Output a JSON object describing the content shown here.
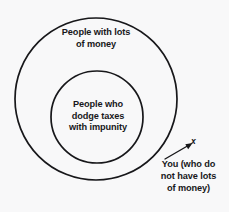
{
  "figure": {
    "background_color": "#f8f8f9",
    "ink_color": "#17171a",
    "type": "venn-diagram",
    "outer_set_label": "People with lots\nof money",
    "inner_set_label": "People who\ndodge taxes\nwith impunity",
    "you_caption": "You (who do\nnot have lots\nof money)",
    "point_marker": "x",
    "geometry": {
      "outer_circle": {
        "cx": 96,
        "cy": 99,
        "r": 81
      },
      "inner_circle": {
        "cx": 97,
        "cy": 117,
        "r": 46
      },
      "marker_point": {
        "x": 195,
        "y": 142
      },
      "arrow_from": {
        "x": 165,
        "y": 159
      },
      "arrow_to": {
        "x": 191,
        "y": 144
      }
    }
  }
}
